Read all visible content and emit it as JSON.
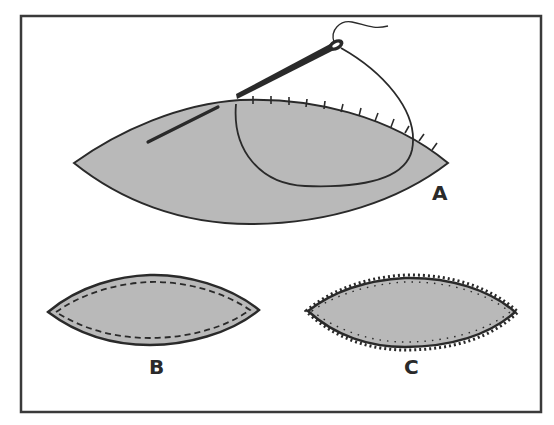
{
  "figure": {
    "colors": {
      "fabric_fill": "#b9b9b9",
      "outline": "#2a2a2a",
      "background": "#ffffff",
      "frame": "#3a3a3a"
    },
    "panels": [
      {
        "id": "A",
        "label": "A",
        "content": "Large fabric piece with needle and thread making whipstitches along the top edge"
      },
      {
        "id": "B",
        "label": "B",
        "content": "Small fabric piece with dashed running stitch inside the edge"
      },
      {
        "id": "C",
        "label": "C",
        "content": "Small fabric piece with blanket/overcast stitch looping around the edge"
      }
    ]
  }
}
